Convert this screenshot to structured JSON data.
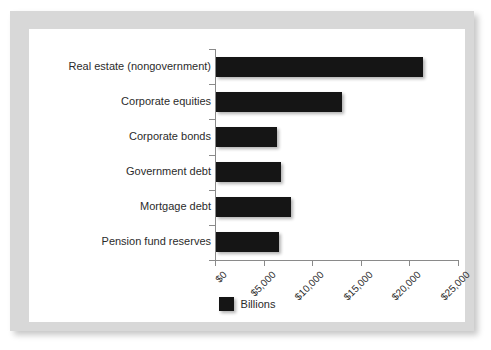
{
  "artifact": {
    "top_fragment": ".. ."
  },
  "legend": {
    "label": "Billions",
    "swatch_color": "#151515",
    "position": "bottom-center"
  },
  "chart_data": {
    "type": "bar",
    "orientation": "horizontal",
    "title": "",
    "subtitle": "",
    "xlabel": "",
    "ylabel": "",
    "categories": [
      "Real estate (nongovernment)",
      "Corporate equities",
      "Corporate bonds",
      "Government debt",
      "Mortgage debt",
      "Pension fund reserves"
    ],
    "series": [
      {
        "name": "Billions",
        "values": [
          21300,
          13000,
          6300,
          6700,
          7700,
          6500
        ]
      }
    ],
    "xlim": [
      0,
      25000
    ],
    "xticks": [
      0,
      5000,
      10000,
      15000,
      20000,
      25000
    ],
    "xtick_labels": [
      "$0",
      "$5,000",
      "$10,000",
      "$15,000",
      "$20,000",
      "$25,000"
    ],
    "xtick_rotation": -45,
    "grid": false,
    "bar_color": "#151515",
    "axis_color": "#8a8a8a",
    "legend_entries": [
      "Billions"
    ]
  }
}
